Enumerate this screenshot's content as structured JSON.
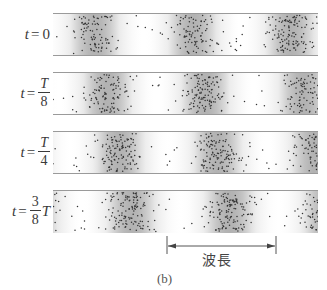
{
  "figure": {
    "caption": "(b)",
    "wavelength_label": "波長",
    "colors": {
      "tube_edge": "#9a9a9a",
      "dense_shade": "#b5b5b5",
      "light_shade": "#ffffff",
      "particle": "#333333"
    },
    "rows": [
      {
        "id": "row-t0",
        "t": "t",
        "eq": "=",
        "num": "0",
        "num_italic": false,
        "den": "",
        "suffix": "",
        "phase_fraction": 0
      },
      {
        "id": "row-t1",
        "t": "t",
        "eq": "=",
        "num": "T",
        "num_italic": true,
        "den": "8",
        "suffix": "",
        "phase_fraction": 0.125
      },
      {
        "id": "row-t2",
        "t": "t",
        "eq": "=",
        "num": "T",
        "num_italic": true,
        "den": "4",
        "suffix": "",
        "phase_fraction": 0.25
      },
      {
        "id": "row-t3",
        "t": "t",
        "eq": "=",
        "num": "3",
        "num_italic": false,
        "den": "8",
        "suffix": "T",
        "phase_fraction": 0.375
      }
    ],
    "wave": {
      "wavelength_px": 98,
      "first_compression_x_at_t0": 42,
      "description": "Longitudinal wave: particle compressions travel right by 1/8 wavelength per step"
    }
  }
}
